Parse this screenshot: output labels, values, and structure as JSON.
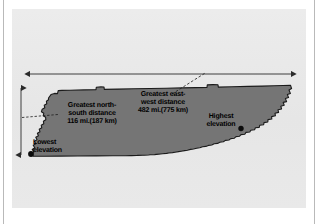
{
  "figure": {
    "kind": "state-dimensions-map",
    "panel_bg_color": "#e9e9e9",
    "map_fill_color": "#757575",
    "map_stroke_color": "#1b1b1b",
    "arrow_color": "#2b2b2b",
    "page_bg_color": "#ffffff"
  },
  "annotations": {
    "north_south": {
      "name": "greatest-north-south-distance",
      "line1": "Greatest north-",
      "line2": "south distance",
      "line3": "116 mi.(187 km)",
      "miles": 116,
      "kilometers": 187
    },
    "east_west": {
      "name": "greatest-east-west-distance",
      "line1": "Greatest east-",
      "line2": "west distance",
      "line3": "482 mi.(775 km)",
      "miles": 482,
      "kilometers": 775
    },
    "highest_elevation": {
      "name": "highest-elevation",
      "line1": "Highest",
      "line2": "elevation"
    },
    "lowest_elevation": {
      "name": "lowest-elevation",
      "line1": "Lowest",
      "line2": "elevation"
    }
  },
  "markers": {
    "highest_elevation_dot": {
      "x": 241,
      "y": 128
    },
    "lowest_elevation_dot": {
      "x": 31,
      "y": 154
    }
  },
  "measure_arrows": {
    "horizontal": {
      "name": "east-west-measure-arrow",
      "x1": 30,
      "x2": 291,
      "y": 74,
      "double_headed": true
    },
    "vertical": {
      "name": "north-south-measure-arrow",
      "x": 21,
      "y1": 88,
      "y2": 155,
      "double_headed": true
    }
  },
  "leader_lines": {
    "north_south_leader": {
      "x1": 22,
      "y1": 117,
      "x2": 58,
      "y2": 114,
      "style": "dashed"
    },
    "east_west_leader": {
      "x1": 173,
      "y1": 93,
      "x2": 205,
      "y2": 73,
      "style": "dashed"
    }
  }
}
